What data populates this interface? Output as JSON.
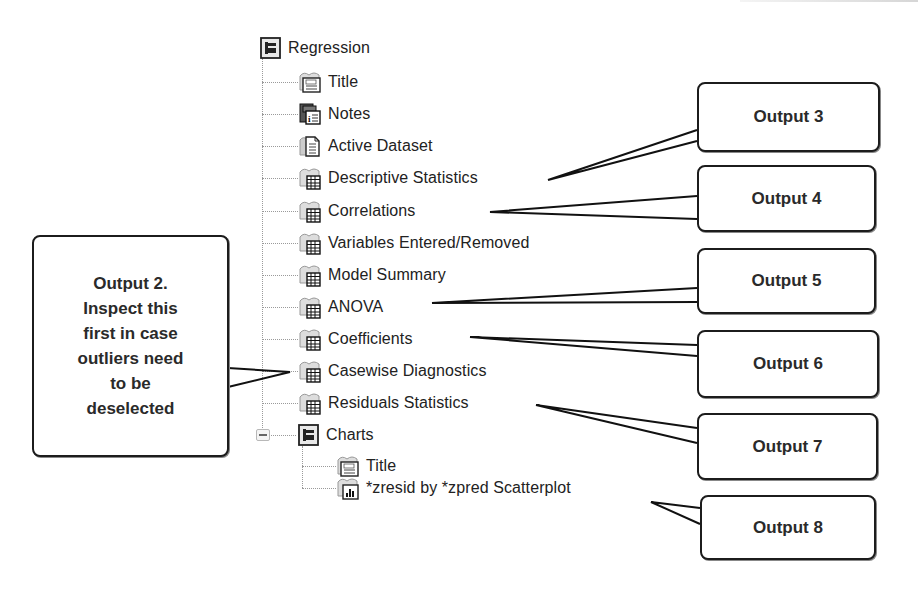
{
  "tree": {
    "root": {
      "label": "Regression",
      "icon": "output-folder-icon"
    },
    "items": [
      {
        "label": "Title",
        "icon": "title-icon"
      },
      {
        "label": "Notes",
        "icon": "notes-icon"
      },
      {
        "label": "Active Dataset",
        "icon": "dataset-icon"
      },
      {
        "label": "Descriptive Statistics",
        "icon": "table-icon"
      },
      {
        "label": "Correlations",
        "icon": "table-icon"
      },
      {
        "label": "Variables Entered/Removed",
        "icon": "table-icon"
      },
      {
        "label": "Model Summary",
        "icon": "table-icon"
      },
      {
        "label": "ANOVA",
        "icon": "table-icon"
      },
      {
        "label": "Coefficients",
        "icon": "table-icon"
      },
      {
        "label": "Casewise Diagnostics",
        "icon": "table-icon"
      },
      {
        "label": "Residuals Statistics",
        "icon": "table-icon"
      }
    ],
    "charts": {
      "label": "Charts",
      "icon": "output-folder-icon",
      "items": [
        {
          "label": "Title",
          "icon": "title-icon"
        },
        {
          "label": "*zresid by *zpred Scatterplot",
          "icon": "chart-icon"
        }
      ]
    }
  },
  "callouts": {
    "output2": "Output 2.\nInspect this first in case outliers need to be deselected",
    "output2_lines": [
      "Output 2.",
      "Inspect this",
      "first in case",
      "outliers need",
      "to be",
      "deselected"
    ],
    "output3": "Output 3",
    "output4": "Output 4",
    "output5": "Output 5",
    "output6": "Output 6",
    "output7": "Output 7",
    "output8": "Output 8"
  }
}
